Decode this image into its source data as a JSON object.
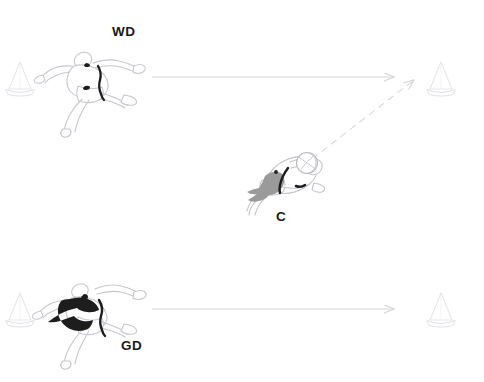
{
  "diagram": {
    "kind": "netball-drill-diagram",
    "background_color": "#ffffff",
    "width": 484,
    "height": 382,
    "labels": {
      "wd": "WD",
      "c": "C",
      "gd": "GD"
    },
    "colors": {
      "cone_stroke": "#e9e9ec",
      "cone_base_stroke": "#e2e2e6",
      "arrow_line": "#d6d6da",
      "arrow_dashed": "#d9d9dd",
      "player_outline": "#c9c9cf",
      "bib_dark": "#1d1d1d",
      "bib_gray": "#9a9a9a",
      "label_text": "#1a1a1a",
      "ball_outline": "#b9b9c0"
    },
    "cones": [
      {
        "name": "cone-top-left",
        "x": 20,
        "y": 80,
        "label": ""
      },
      {
        "name": "cone-top-right",
        "x": 441,
        "y": 80,
        "label": ""
      },
      {
        "name": "cone-bottom-left",
        "x": 20,
        "y": 311,
        "label": ""
      },
      {
        "name": "cone-bottom-right",
        "x": 441,
        "y": 311,
        "label": ""
      }
    ],
    "players": [
      {
        "name": "player-wd",
        "position_code": "WD",
        "role": "Wing Defence",
        "bib_style": "outline",
        "has_ball": false,
        "x": 95,
        "y": 90,
        "label_x": 112,
        "label_y": 25
      },
      {
        "name": "player-c",
        "position_code": "C",
        "role": "Centre",
        "bib_style": "gray",
        "has_ball": true,
        "x": 286,
        "y": 182,
        "label_x": 276,
        "label_y": 210
      },
      {
        "name": "player-gd",
        "position_code": "GD",
        "role": "Goal Defence",
        "bib_style": "black",
        "has_ball": false,
        "x": 95,
        "y": 314,
        "label_x": 121,
        "label_y": 339
      }
    ],
    "arrows": [
      {
        "name": "arrow-wd-run",
        "style": "solid",
        "meaning": "WD runs right",
        "x1": 152,
        "y1": 77,
        "x2": 395,
        "y2": 77
      },
      {
        "name": "arrow-gd-run",
        "style": "solid",
        "meaning": "GD runs right",
        "x1": 152,
        "y1": 309,
        "x2": 395,
        "y2": 309
      },
      {
        "name": "arrow-c-pass",
        "style": "dashed",
        "meaning": "C passes ball to top-right cone area",
        "x1": 312,
        "y1": 159,
        "x2": 417,
        "y2": 78
      }
    ]
  }
}
